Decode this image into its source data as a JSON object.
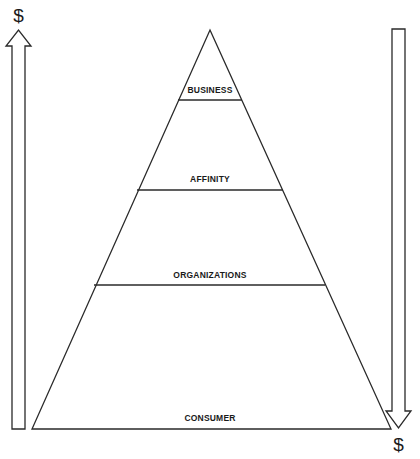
{
  "diagram": {
    "type": "pyramid",
    "tiers": [
      {
        "label": "BUSINESS"
      },
      {
        "label": "AFFINITY"
      },
      {
        "label": "ORGANIZATIONS"
      },
      {
        "label": "CONSUMER"
      }
    ],
    "left_arrow": {
      "direction": "up",
      "label": "$"
    },
    "right_arrow": {
      "direction": "down",
      "label": "$"
    },
    "colors": {
      "line": "#2a2a2a",
      "background": "#ffffff",
      "text": "#1a1a1a"
    }
  }
}
